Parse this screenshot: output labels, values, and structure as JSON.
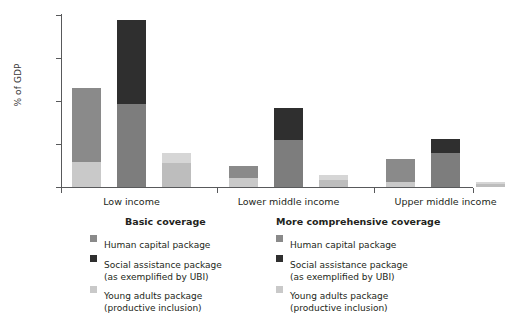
{
  "chart_data": {
    "type": "bar",
    "subtype": "stacked-grouped",
    "title": "",
    "xlabel": "",
    "ylabel": "% of GDP",
    "ylim": [
      0,
      20
    ],
    "yticks": [
      0,
      5,
      10,
      15,
      20
    ],
    "ytick_labels": [
      "0",
      "5",
      "10",
      "15",
      "20"
    ],
    "grid": false,
    "legend_position": "bottom",
    "categories": [
      "Low income",
      "Lower middle income",
      "Upper middle income"
    ],
    "bar_groups": [
      {
        "coverage": "Basic coverage",
        "package": "Human capital package",
        "color": "#8a8a8a",
        "base_color": "#c9c9c9",
        "values": [
          11.5,
          2.4,
          3.3
        ],
        "base_values": [
          2.9,
          1.0,
          0.6
        ]
      },
      {
        "coverage": "More comprehensive coverage",
        "package": "Social assistance package (as exemplified by UBI)",
        "color": "#2f2f2f",
        "base_color": "#7d7d7d",
        "values": [
          19.4,
          9.2,
          5.6
        ],
        "base_values": [
          9.7,
          5.5,
          4.0
        ]
      },
      {
        "coverage": "Basic / comprehensive",
        "package": "Young adults package (productive inclusion)",
        "color": "#d6d6d6",
        "base_color": "#bdbdbd",
        "values": [
          4.0,
          1.4,
          0.55
        ],
        "base_values": [
          2.8,
          0.85,
          0.3
        ]
      }
    ],
    "series": [
      {
        "name": "Human capital package",
        "values": [
          11.5,
          2.4,
          3.3
        ],
        "color": "#8a8a8a"
      },
      {
        "name": "Social assistance package (as exemplified by UBI)",
        "values": [
          19.4,
          9.2,
          5.6
        ],
        "color": "#2f2f2f"
      },
      {
        "name": "Young adults package (productive inclusion)",
        "values": [
          4.0,
          1.4,
          0.55
        ],
        "color": "#d6d6d6"
      }
    ],
    "annotations": []
  },
  "axis": {
    "y_title": "% of GDP",
    "ticks": [
      {
        "label": "20",
        "value": 20
      },
      {
        "label": "15",
        "value": 15
      },
      {
        "label": "10",
        "value": 10
      },
      {
        "label": "5",
        "value": 5
      },
      {
        "label": "0",
        "value": 0
      }
    ]
  },
  "categories": [
    {
      "label": "Low income"
    },
    {
      "label": "Lower middle income"
    },
    {
      "label": "Upper middle income"
    }
  ],
  "bars": [
    {
      "name": "low-income-human-capital",
      "value": 11.5,
      "top_color": "#8a8a8a",
      "bottom_color": "#c9c9c9",
      "split": 2.9
    },
    {
      "name": "low-income-social-assistance",
      "value": 19.4,
      "top_color": "#2f2f2f",
      "bottom_color": "#7d7d7d",
      "split": 9.7
    },
    {
      "name": "low-income-young-adults",
      "value": 4.0,
      "top_color": "#d6d6d6",
      "bottom_color": "#bdbdbd",
      "split": 2.8
    },
    {
      "name": "lower-middle-human-capital",
      "value": 2.4,
      "top_color": "#8a8a8a",
      "bottom_color": "#c9c9c9",
      "split": 1.0
    },
    {
      "name": "lower-middle-social-assistance",
      "value": 9.2,
      "top_color": "#2f2f2f",
      "bottom_color": "#7d7d7d",
      "split": 5.5
    },
    {
      "name": "lower-middle-young-adults",
      "value": 1.4,
      "top_color": "#d6d6d6",
      "bottom_color": "#bdbdbd",
      "split": 0.85
    },
    {
      "name": "upper-middle-human-capital",
      "value": 3.3,
      "top_color": "#8a8a8a",
      "bottom_color": "#c9c9c9",
      "split": 0.6
    },
    {
      "name": "upper-middle-social-assistance",
      "value": 5.6,
      "top_color": "#2f2f2f",
      "bottom_color": "#7d7d7d",
      "split": 4.0
    },
    {
      "name": "upper-middle-young-adults",
      "value": 0.55,
      "top_color": "#d6d6d6",
      "bottom_color": "#bdbdbd",
      "split": 0.3
    }
  ],
  "legend": {
    "basic": {
      "title": "Basic coverage",
      "entries": [
        {
          "swatch": "#8a8a8a",
          "line1": "Human capital package",
          "line2": ""
        },
        {
          "swatch": "#2f2f2f",
          "line1": "Social assistance package",
          "line2": "(as exemplified by UBI)"
        },
        {
          "swatch": "#c9c9c9",
          "line1": "Young adults package",
          "line2": "(productive inclusion)"
        }
      ]
    },
    "comprehensive": {
      "title": "More comprehensive coverage",
      "entries": [
        {
          "swatch": "#8a8a8a",
          "line1": "Human capital package",
          "line2": ""
        },
        {
          "swatch": "#2f2f2f",
          "line1": "Social assistance package",
          "line2": "(as exemplified by UBI)"
        },
        {
          "swatch": "#c9c9c9",
          "line1": "Young adults package",
          "line2": "(productive inclusion)"
        }
      ]
    }
  },
  "colors": {
    "human_capital": "#8a8a8a",
    "social_assistance": "#2f2f2f",
    "young_adults": "#d6d6d6",
    "axis": "#58595b",
    "text": "#231f20"
  }
}
